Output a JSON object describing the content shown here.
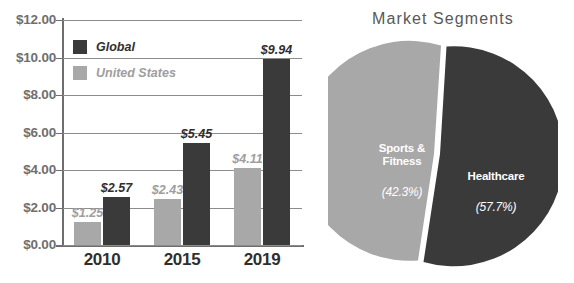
{
  "bar_chart": {
    "y_axis_ticks": [
      "$12.00",
      "$10.00",
      "$8.00",
      "$6.00",
      "$4.00",
      "$2.00",
      "$0.00"
    ],
    "x_axis_ticks": [
      "2010",
      "2015",
      "2019"
    ],
    "legend": [
      {
        "label": "Global",
        "color": "#3a3a3a"
      },
      {
        "label": "United States",
        "color": "#a8a8a8"
      }
    ],
    "bar_labels": {
      "us_2010": "$1.25",
      "global_2010": "$2.57",
      "us_2015": "$2.43",
      "global_2015": "$5.45",
      "us_2019": "$4.11",
      "global_2019": "$9.94"
    }
  },
  "pie_chart": {
    "title": "Market Segments",
    "segments": [
      {
        "name": "Healthcare",
        "pct_label": "(57.7%)",
        "color": "#3a3a3a"
      },
      {
        "name": "Sports &\nFitness",
        "pct_label": "(42.3%)",
        "color": "#a8a8a8"
      }
    ]
  },
  "chart_data": [
    {
      "type": "bar",
      "title": "",
      "xlabel": "",
      "ylabel": "",
      "categories": [
        "2010",
        "2015",
        "2019"
      ],
      "series": [
        {
          "name": "United States",
          "values": [
            1.25,
            2.43,
            4.11
          ],
          "color": "#a8a8a8"
        },
        {
          "name": "Global",
          "values": [
            2.57,
            5.45,
            9.94
          ],
          "color": "#3a3a3a"
        }
      ],
      "data_labels": [
        [
          "$1.25",
          "$2.43",
          "$4.11"
        ],
        [
          "$2.57",
          "$5.45",
          "$9.94"
        ]
      ],
      "ylim": [
        0,
        12
      ],
      "ytick_values": [
        0,
        2,
        4,
        6,
        8,
        10,
        12
      ],
      "ytick_labels": [
        "$0.00",
        "$2.00",
        "$4.00",
        "$6.00",
        "$8.00",
        "$10.00",
        "$12.00"
      ],
      "grid": true,
      "legend_position": "top-left"
    },
    {
      "type": "pie",
      "title": "Market Segments",
      "labels": [
        "Healthcare",
        "Sports & Fitness"
      ],
      "values": [
        57.7,
        42.3
      ],
      "value_labels": [
        "(57.7%)",
        "(42.3%)"
      ],
      "colors": [
        "#3a3a3a",
        "#a8a8a8"
      ],
      "legend_position": "none",
      "grid": false
    }
  ]
}
